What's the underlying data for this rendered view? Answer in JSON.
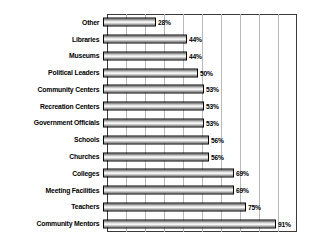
{
  "chart_data": {
    "type": "bar",
    "orientation": "horizontal",
    "title": "",
    "subtitle": "",
    "xlabel": "",
    "ylabel": "",
    "xlim": [
      0,
      100
    ],
    "grid": "vertical",
    "legend": "none",
    "value_suffix": "%",
    "gridline_count": 10,
    "categories": [
      "Other",
      "Libraries",
      "Museums",
      "Political Leaders",
      "Community Centers",
      "Recreation Centers",
      "Government Officials",
      "Schools",
      "Churches",
      "Colleges",
      "Meeting Facilities",
      "Teachers",
      "Community Mentors"
    ],
    "values": [
      28,
      44,
      44,
      50,
      53,
      53,
      53,
      56,
      56,
      69,
      69,
      75,
      91
    ],
    "value_labels": [
      "28%",
      "44%",
      "44%",
      "50%",
      "53%",
      "53%",
      "53%",
      "56%",
      "56%",
      "69%",
      "69%",
      "75%",
      "91%"
    ],
    "colors": {
      "bar_fill_light": "#ffffff",
      "bar_fill_mid": "#c9c9c9",
      "bar_fill_dark": "#6e6e6e",
      "bar_outline": "#000000",
      "gridline": "#b9b9b9",
      "frame": "#3a3a3a",
      "text": "#000000",
      "background": "#ffffff"
    }
  }
}
